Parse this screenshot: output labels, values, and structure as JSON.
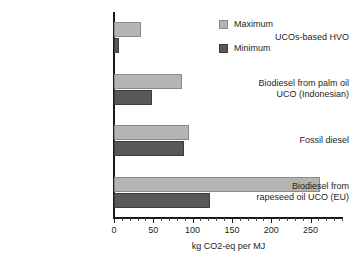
{
  "chart_data": {
    "type": "bar",
    "orientation": "horizontal",
    "title": "",
    "xlabel": "kg CO2-eq per MJ",
    "ylabel": "",
    "xlim": [
      0,
      290
    ],
    "xticks": [
      0,
      50,
      100,
      150,
      200,
      250
    ],
    "xtick_labels": [
      "0",
      "50",
      "100",
      "150",
      "200",
      "250"
    ],
    "minor_tick_interval": 10,
    "grid": false,
    "legend_position": "top-right",
    "categories": [
      "UCOs-based HVO",
      "Biodiesel from palm oil UCO (Indonesian)",
      "Fossil diesel",
      "Biodiesel from rapeseed oil UCO (EU)"
    ],
    "category_lines": [
      [
        "UCOs-based HVO"
      ],
      [
        "Biodiesel from palm oil",
        "UCO (Indonesian)"
      ],
      [
        "Fossil diesel"
      ],
      [
        "Biodiesel from",
        "rapeseed oil UCO (EU)"
      ]
    ],
    "series": [
      {
        "name": "Maximum",
        "color": "#b4b4b4",
        "values": [
          34,
          86,
          95,
          262
        ]
      },
      {
        "name": "Minimum",
        "color": "#585858",
        "values": [
          6,
          48,
          89,
          122
        ]
      }
    ]
  },
  "legend": {
    "items": [
      {
        "label": "Maximum",
        "swatch": "maximum-swatch"
      },
      {
        "label": "Minimum",
        "swatch": "minimum-swatch"
      }
    ]
  }
}
